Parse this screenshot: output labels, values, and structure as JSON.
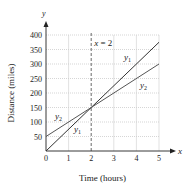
{
  "chart_data": {
    "type": "line",
    "title": "",
    "xlabel": "Time (hours)",
    "ylabel": "Distance (miles)",
    "x_axis_symbol": "x",
    "y_axis_symbol": "y",
    "xlim": [
      0,
      5
    ],
    "ylim": [
      0,
      400
    ],
    "xticks": [
      0,
      1,
      2,
      3,
      4,
      5
    ],
    "yticks": [
      50,
      100,
      150,
      200,
      250,
      300,
      350,
      400
    ],
    "grid": true,
    "series": [
      {
        "name": "y1",
        "x": [
          0,
          5
        ],
        "values": [
          0,
          375
        ],
        "color": "#333333"
      },
      {
        "name": "y2",
        "x": [
          0,
          5
        ],
        "values": [
          50,
          300
        ],
        "color": "#555555"
      }
    ],
    "annotations": [
      {
        "text": "x = 2",
        "type": "vertical-dashed-line",
        "x": 2
      },
      {
        "text": "y1",
        "near": [
          4.3,
          345
        ]
      },
      {
        "text": "y2",
        "near": [
          4.4,
          230
        ]
      },
      {
        "text": "y2",
        "near": [
          0.5,
          115
        ]
      },
      {
        "text": "y1",
        "near": [
          1.3,
          80
        ]
      }
    ],
    "intersection": {
      "x": 2,
      "y": 150
    }
  }
}
